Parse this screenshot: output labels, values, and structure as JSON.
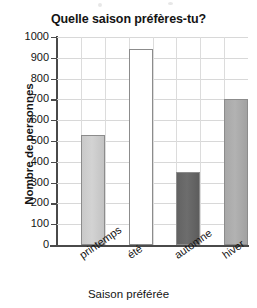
{
  "chart_data": {
    "type": "bar",
    "title": "Quelle saison préfères-tu?",
    "xlabel": "Saison préférée",
    "ylabel": "Nombre de personnes",
    "categories": [
      "printemps",
      "été",
      "automne",
      "hiver"
    ],
    "values": [
      530,
      940,
      350,
      700
    ],
    "ylim": [
      0,
      1000
    ],
    "ytick_labels": [
      "1000",
      "900",
      "800",
      "700",
      "600",
      "500",
      "400",
      "300",
      "200",
      "100",
      "0"
    ],
    "ytick_values": [
      1000,
      900,
      800,
      700,
      600,
      500,
      400,
      300,
      200,
      100,
      0
    ],
    "grid": true,
    "legend": "none",
    "bar_colors": [
      "#c9c9c9",
      "#ffffff",
      "#636363",
      "#a8a8a8"
    ],
    "bar_border_color": "#8c8c8c",
    "axis_color": "#4a4a4a",
    "grid_color": "#d8d8d8",
    "text_color": "#141414"
  }
}
